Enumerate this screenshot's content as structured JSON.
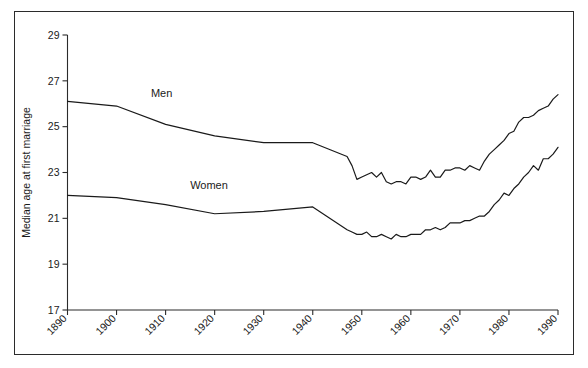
{
  "figure": {
    "border_color": "#2b2b2b",
    "background": "#ffffff"
  },
  "chart_data": {
    "type": "line",
    "title": "",
    "subtitle": "",
    "xlabel": "",
    "ylabel": "Median age at first marriage",
    "xlim": [
      1890,
      1990
    ],
    "ylim": [
      17,
      29
    ],
    "xticks": [
      1890,
      1900,
      1910,
      1920,
      1930,
      1940,
      1950,
      1960,
      1970,
      1980,
      1990
    ],
    "xtick_labels": [
      "1890",
      "1900",
      "1910",
      "1920",
      "1930",
      "1940",
      "1950",
      "1960",
      "1970",
      "1980",
      "1990"
    ],
    "yticks": [
      17,
      19,
      21,
      23,
      25,
      27,
      29
    ],
    "ytick_labels": [
      "17",
      "19",
      "21",
      "23",
      "25",
      "27",
      "29"
    ],
    "xtick_label_rotation": -45,
    "grid": false,
    "legend": "inline-annotations",
    "annotations": [
      {
        "text": "Men",
        "x": 1907,
        "y": 26.3
      },
      {
        "text": "Women",
        "x": 1915,
        "y": 22.3
      }
    ],
    "series": [
      {
        "name": "Men",
        "label": "Men",
        "color": "#1a1a1a",
        "x": [
          1890,
          1900,
          1910,
          1920,
          1930,
          1940,
          1947,
          1948,
          1949,
          1950,
          1951,
          1952,
          1953,
          1954,
          1955,
          1956,
          1957,
          1958,
          1959,
          1960,
          1961,
          1962,
          1963,
          1964,
          1965,
          1966,
          1967,
          1968,
          1969,
          1970,
          1971,
          1972,
          1973,
          1974,
          1975,
          1976,
          1977,
          1978,
          1979,
          1980,
          1981,
          1982,
          1983,
          1984,
          1985,
          1986,
          1987,
          1988,
          1989,
          1990
        ],
        "values": [
          26.1,
          25.9,
          25.1,
          24.6,
          24.3,
          24.3,
          23.7,
          23.3,
          22.7,
          22.8,
          22.9,
          23.0,
          22.8,
          23.0,
          22.6,
          22.5,
          22.6,
          22.6,
          22.5,
          22.8,
          22.8,
          22.7,
          22.8,
          23.1,
          22.8,
          22.8,
          23.1,
          23.1,
          23.2,
          23.2,
          23.1,
          23.3,
          23.2,
          23.1,
          23.5,
          23.8,
          24.0,
          24.2,
          24.4,
          24.7,
          24.8,
          25.2,
          25.4,
          25.4,
          25.5,
          25.7,
          25.8,
          25.9,
          26.2,
          26.4
        ]
      },
      {
        "name": "Women",
        "label": "Women",
        "color": "#1a1a1a",
        "x": [
          1890,
          1900,
          1910,
          1920,
          1930,
          1940,
          1947,
          1948,
          1949,
          1950,
          1951,
          1952,
          1953,
          1954,
          1955,
          1956,
          1957,
          1958,
          1959,
          1960,
          1961,
          1962,
          1963,
          1964,
          1965,
          1966,
          1967,
          1968,
          1969,
          1970,
          1971,
          1972,
          1973,
          1974,
          1975,
          1976,
          1977,
          1978,
          1979,
          1980,
          1981,
          1982,
          1983,
          1984,
          1985,
          1986,
          1987,
          1988,
          1989,
          1990
        ],
        "values": [
          22.0,
          21.9,
          21.6,
          21.2,
          21.3,
          21.5,
          20.5,
          20.4,
          20.3,
          20.3,
          20.4,
          20.2,
          20.2,
          20.3,
          20.2,
          20.1,
          20.3,
          20.2,
          20.2,
          20.3,
          20.3,
          20.3,
          20.5,
          20.5,
          20.6,
          20.5,
          20.6,
          20.8,
          20.8,
          20.8,
          20.9,
          20.9,
          21.0,
          21.1,
          21.1,
          21.3,
          21.6,
          21.8,
          22.1,
          22.0,
          22.3,
          22.5,
          22.8,
          23.0,
          23.3,
          23.1,
          23.6,
          23.6,
          23.8,
          24.1
        ]
      }
    ]
  }
}
